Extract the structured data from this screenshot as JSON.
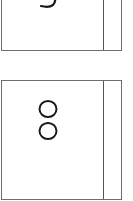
{
  "tiles": [
    {
      "id": "tile-1",
      "symbol": "3",
      "symbol_visible": "partial-bottom",
      "border_color": "#6e6e6e",
      "divider_color": "#555555"
    },
    {
      "id": "tile-2",
      "symbol": "8",
      "symbol_visible": "full",
      "border_color": "#6e6e6e",
      "divider_color": "#555555"
    }
  ],
  "colors": {
    "background": "#ffffff",
    "ink": "#1a1a1a"
  }
}
